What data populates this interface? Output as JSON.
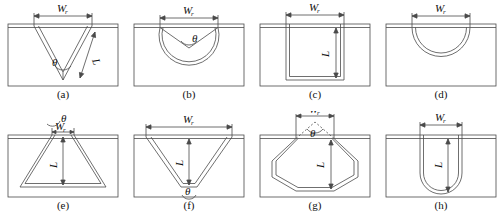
{
  "figure": {
    "type": "technical-diagram",
    "panel_count": 8,
    "rows": 2,
    "columns": 4,
    "line_color": "#4a4a4a",
    "plate_color": "#ffffff",
    "background": "#ffffff"
  },
  "symbols": {
    "width": "W",
    "width_subscript": "r",
    "depth": "L",
    "angle": "θ"
  },
  "panels": [
    {
      "id": "a",
      "caption": "(a)",
      "shape": "v-groove",
      "labels": [
        "W",
        "r",
        "L",
        "θ"
      ],
      "has_width": true,
      "has_depth": true,
      "has_angle": true,
      "angle_position": "bottom-apex",
      "depth_label_position": "right-slant"
    },
    {
      "id": "b",
      "caption": "(b)",
      "shape": "circular-groove-with-v-notch",
      "labels": [
        "W",
        "r",
        "θ"
      ],
      "has_width": true,
      "has_depth": false,
      "has_angle": true,
      "angle_position": "notch-apex",
      "depth_label_position": "none"
    },
    {
      "id": "c",
      "caption": "(c)",
      "shape": "rectangular-groove",
      "labels": [
        "W",
        "r",
        "L"
      ],
      "has_width": true,
      "has_depth": true,
      "has_angle": false,
      "angle_position": "none",
      "depth_label_position": "center-vertical"
    },
    {
      "id": "d",
      "caption": "(d)",
      "shape": "semicircular-groove",
      "labels": [
        "W",
        "r"
      ],
      "has_width": true,
      "has_depth": false,
      "has_angle": false,
      "angle_position": "none",
      "depth_label_position": "none"
    },
    {
      "id": "e",
      "caption": "(e)",
      "shape": "inverted-trapezoid-groove",
      "labels": [
        "W",
        "r",
        "L",
        "θ"
      ],
      "has_width": true,
      "has_depth": true,
      "has_angle": true,
      "angle_position": "top-narrow-opening",
      "depth_label_position": "center-vertical"
    },
    {
      "id": "f",
      "caption": "(f)",
      "shape": "trapezoid-groove-flat-bottom",
      "labels": [
        "W",
        "r",
        "L",
        "θ"
      ],
      "has_width": true,
      "has_depth": true,
      "has_angle": true,
      "angle_position": "bottom-flat",
      "depth_label_position": "center-vertical"
    },
    {
      "id": "g",
      "caption": "(g)",
      "shape": "hexagonal-groove",
      "labels": [
        "W",
        "r",
        "L",
        "θ"
      ],
      "has_width": true,
      "has_depth": true,
      "has_angle": true,
      "angle_position": "virtual-apex-above-surface",
      "depth_label_position": "center-vertical"
    },
    {
      "id": "h",
      "caption": "(h)",
      "shape": "u-groove",
      "labels": [
        "W",
        "r",
        "L"
      ],
      "has_width": true,
      "has_depth": true,
      "has_angle": false,
      "angle_position": "none",
      "depth_label_position": "center-vertical"
    }
  ]
}
